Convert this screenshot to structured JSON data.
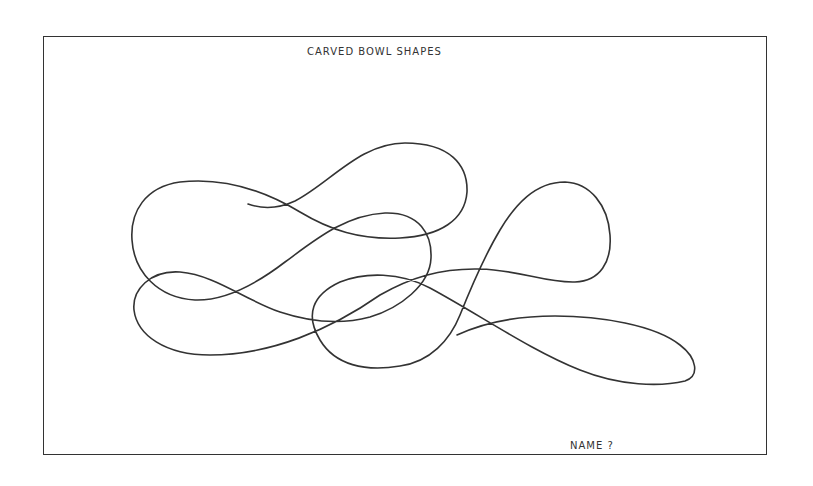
{
  "sheet": {
    "title": "CARVED BOWL SHAPES",
    "footer_label": "NAME ?"
  },
  "drawing": {
    "description": "Single continuous freehand curved line forming overlapping loops",
    "stroke_color": "#333333",
    "stroke_width": 1.6
  }
}
